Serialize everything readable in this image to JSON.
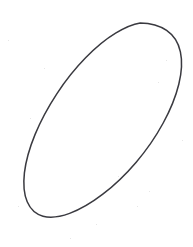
{
  "image": {
    "kind": "scanned-hand-drawing",
    "width": 193,
    "height": 247,
    "background_color": "#ffffff",
    "has_text": false,
    "caption": ""
  },
  "drawing": {
    "title": "Hand-drawn tilted ellipse outline",
    "shape_name": "ellipse",
    "shape_count": 1,
    "stroke_color": "#3a3a40",
    "stroke_width_px": 1.5,
    "fill": "none",
    "style": "hand-drawn pencil/ink outline, slightly wobbly, closed curve",
    "geometry": {
      "center_x": 96,
      "center_y": 129,
      "semi_major_px": 112,
      "semi_minor_px": 62,
      "rotation_deg": -58,
      "extremes": {
        "top_apex": [
          140,
          23
        ],
        "right_extreme": [
          181,
          100
        ],
        "bottom_apex": [
          52,
          236
        ],
        "left_extreme": [
          11,
          160
        ]
      }
    },
    "outline_path": "M 140.0 23.2 C 151.5 23.8 161.8 27.4 169.2 34.2 C 176.9 41.3 180.9 51.6 181.2 64.0 C 181.5 76.6 178.4 90.8 172.4 105.4 C 166.3 120.2 157.5 135.2 146.6 149.4 C 135.6 163.8 123.0 176.9 109.9 187.7 C 96.7 198.6 83.4 206.9 71.2 211.9 C 64.8 214.6 58.8 216.2 53.4 216.6 C 47.7 217.0 42.7 216.1 38.6 213.9 C 34.3 211.6 31.0 207.9 28.9 203.0 C 26.7 197.9 25.8 191.6 26.2 184.4 C 26.9 171.8 31.4 156.9 39.0 141.3 C 46.6 125.6 57.0 109.8 69.0 95.2 C 81.1 80.5 94.2 67.5 106.8 57.6 C 119.3 47.8 131.0 41.3 140.6 38.9 L 140.0 23.2 Z",
    "note": "Single closed elliptical contour occupying most of the frame, major axis running from lower-left to upper-right."
  }
}
